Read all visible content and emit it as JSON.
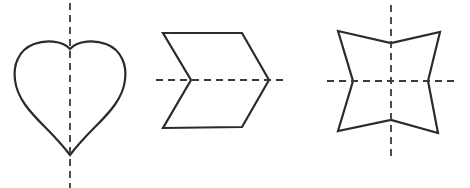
{
  "figure": {
    "colors": {
      "stroke": "#2b2b2b",
      "axis": "#3a3a3a",
      "background": "#ffffff"
    },
    "shapes": [
      {
        "name": "heart",
        "symmetry_lines": [
          "vertical"
        ],
        "axes": [
          {
            "orientation": "vertical",
            "x1": 70,
            "y1": 3,
            "x2": 70,
            "y2": 188
          }
        ]
      },
      {
        "name": "chevron",
        "symmetry_lines": [
          "horizontal"
        ],
        "points": "163,33 242,33 269,80 242,127 163,128 191,80",
        "axes": [
          {
            "orientation": "horizontal",
            "x1": 156,
            "y1": 80,
            "x2": 288,
            "y2": 80
          }
        ]
      },
      {
        "name": "concave-star-square",
        "symmetry_lines": [
          "vertical",
          "horizontal"
        ],
        "points": "338,31 391,43 440,32 428,81 438,133 391,120 338,131 353,81",
        "axes": [
          {
            "orientation": "vertical",
            "x1": 391,
            "y1": 5,
            "x2": 391,
            "y2": 158
          },
          {
            "orientation": "horizontal",
            "x1": 327,
            "y1": 81,
            "x2": 457,
            "y2": 81
          }
        ]
      }
    ]
  }
}
